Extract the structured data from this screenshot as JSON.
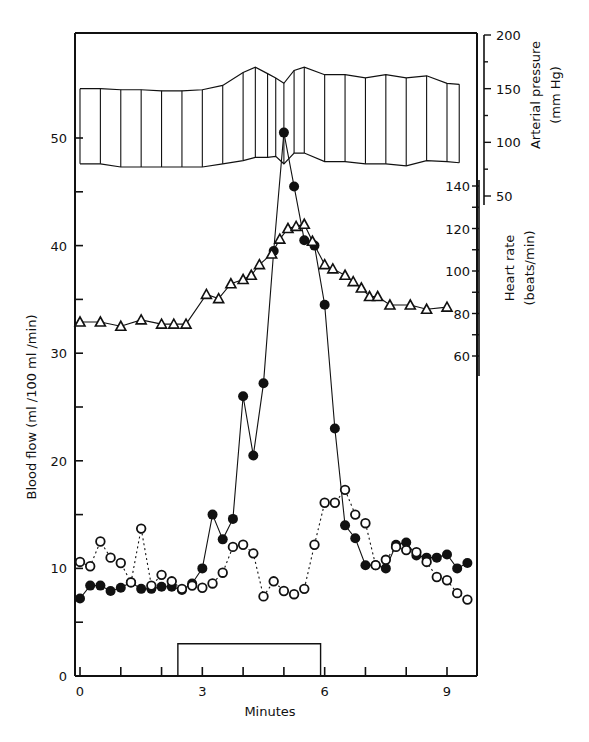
{
  "chart_data": {
    "type": "line",
    "title": "",
    "xlabel": "Minutes",
    "ylabel": "Blood flow (ml /100 ml /min)",
    "y2label_top": "Arterial pressure (mm Hg)",
    "y2label_bottom": "Heart rate (beats/min)",
    "xlim": [
      -0.2,
      9.7
    ],
    "ylim": [
      0,
      58
    ],
    "x_ticks": [
      0,
      1,
      2,
      3,
      4,
      5,
      6,
      7,
      8,
      9
    ],
    "x_tick_labels": [
      "0",
      "3",
      "6",
      "9"
    ],
    "y_ticks": [
      0,
      5,
      10,
      15,
      20,
      25,
      30,
      35,
      40,
      45,
      50
    ],
    "y_tick_labels": [
      "0",
      "10",
      "20",
      "30",
      "40",
      "50"
    ],
    "arterial_pressure_axis": {
      "ticks": [
        50,
        100,
        150,
        200
      ],
      "labels": [
        "50",
        "100",
        "150",
        "200"
      ]
    },
    "heart_rate_axis": {
      "ticks": [
        60,
        70,
        80,
        90,
        100,
        110,
        120,
        130,
        140
      ],
      "labels": [
        "60",
        "80",
        "100",
        "120",
        "140"
      ]
    },
    "stimulus_bar": {
      "start": 2.4,
      "end": 5.9,
      "height": 3
    },
    "series": [
      {
        "name": "Blood flow (filled circles)",
        "marker": "filled-circle",
        "line": "solid",
        "x": [
          0,
          0.25,
          0.5,
          0.75,
          1.0,
          1.25,
          1.5,
          1.75,
          2.0,
          2.25,
          2.5,
          2.75,
          3.0,
          3.25,
          3.5,
          3.75,
          4.0,
          4.25,
          4.5,
          4.75,
          5.0,
          5.25,
          5.5,
          5.75,
          6.0,
          6.25,
          6.5,
          6.75,
          7.0,
          7.25,
          7.5,
          7.75,
          8.0,
          8.25,
          8.5,
          8.75,
          9.0,
          9.25,
          9.5
        ],
        "values": [
          7.2,
          8.4,
          8.4,
          7.9,
          8.2,
          8.7,
          8.1,
          8.1,
          8.3,
          8.3,
          8.0,
          8.6,
          10.0,
          15.0,
          12.7,
          14.6,
          26.0,
          20.5,
          27.2,
          39.5,
          50.5,
          45.5,
          40.5,
          40.0,
          34.5,
          23.0,
          14.0,
          12.8,
          10.3,
          10.3,
          10.0,
          12.2,
          12.4,
          11.2,
          11.0,
          11.0,
          11.3,
          10.0,
          10.5
        ]
      },
      {
        "name": "Blood flow (open circles)",
        "marker": "open-circle",
        "line": "dotted",
        "x": [
          0,
          0.25,
          0.5,
          0.75,
          1.0,
          1.25,
          1.5,
          1.75,
          2.0,
          2.25,
          2.5,
          2.75,
          3.0,
          3.25,
          3.5,
          3.75,
          4.0,
          4.25,
          4.5,
          4.75,
          5.0,
          5.25,
          5.5,
          5.75,
          6.0,
          6.25,
          6.5,
          6.75,
          7.0,
          7.25,
          7.5,
          7.75,
          8.0,
          8.25,
          8.5,
          8.75,
          9.0,
          9.25,
          9.5
        ],
        "values": [
          10.6,
          10.2,
          12.5,
          11.0,
          10.5,
          8.7,
          13.7,
          8.4,
          9.4,
          8.8,
          8.1,
          8.4,
          8.2,
          8.6,
          9.6,
          12.0,
          12.2,
          11.4,
          7.4,
          8.8,
          7.9,
          7.6,
          8.1,
          12.2,
          16.1,
          16.1,
          17.3,
          15.0,
          14.2,
          10.3,
          10.8,
          12.0,
          11.7,
          11.5,
          10.6,
          9.2,
          8.9,
          7.7,
          7.1
        ]
      },
      {
        "name": "Heart rate (open triangles)",
        "marker": "open-triangle",
        "line": "solid",
        "axis": "heart_rate",
        "x": [
          0,
          0.5,
          1.0,
          1.5,
          2.0,
          2.3,
          2.6,
          3.1,
          3.4,
          3.7,
          4.0,
          4.2,
          4.4,
          4.7,
          4.9,
          5.1,
          5.3,
          5.5,
          5.7,
          6.0,
          6.2,
          6.5,
          6.7,
          6.9,
          7.1,
          7.3,
          7.6,
          8.1,
          8.5,
          9.0
        ],
        "values": [
          76,
          76,
          74,
          77,
          75,
          75,
          75,
          89,
          87,
          94,
          96,
          98,
          103,
          108,
          115,
          120,
          121,
          122,
          114,
          103,
          101,
          98,
          95,
          92,
          88,
          88,
          84,
          84,
          82,
          83
        ]
      },
      {
        "name": "Arterial pressure (systolic upper / diastolic lower)",
        "marker": "none",
        "line": "solid-envelope-with-verticals",
        "axis": "arterial_pressure",
        "x": [
          0,
          0.5,
          1.0,
          1.5,
          2.0,
          2.5,
          3.0,
          3.5,
          4.0,
          4.3,
          4.6,
          4.8,
          5.0,
          5.25,
          5.5,
          6.0,
          6.5,
          7.0,
          7.5,
          8.0,
          8.5,
          9.0,
          9.3
        ],
        "systolic": [
          150,
          150,
          149,
          149,
          148,
          148,
          149,
          153,
          165,
          170,
          164,
          160,
          155,
          167,
          170,
          163,
          163,
          160,
          163,
          160,
          162,
          155,
          154
        ],
        "diastolic": [
          80,
          80,
          77,
          77,
          77,
          77,
          77,
          80,
          83,
          86,
          86,
          87,
          80,
          90,
          90,
          82,
          82,
          80,
          80,
          78,
          83,
          82,
          81
        ]
      }
    ],
    "grid": false,
    "legend": "none"
  },
  "labels": {
    "xlabel": "Minutes",
    "ylabel": "Blood flow (ml /100 ml /min)",
    "ap_title_1": "Arterial pressure",
    "ap_title_2": "(mm Hg)",
    "hr_title_1": "Heart rate",
    "hr_title_2": "(beats/min)"
  }
}
